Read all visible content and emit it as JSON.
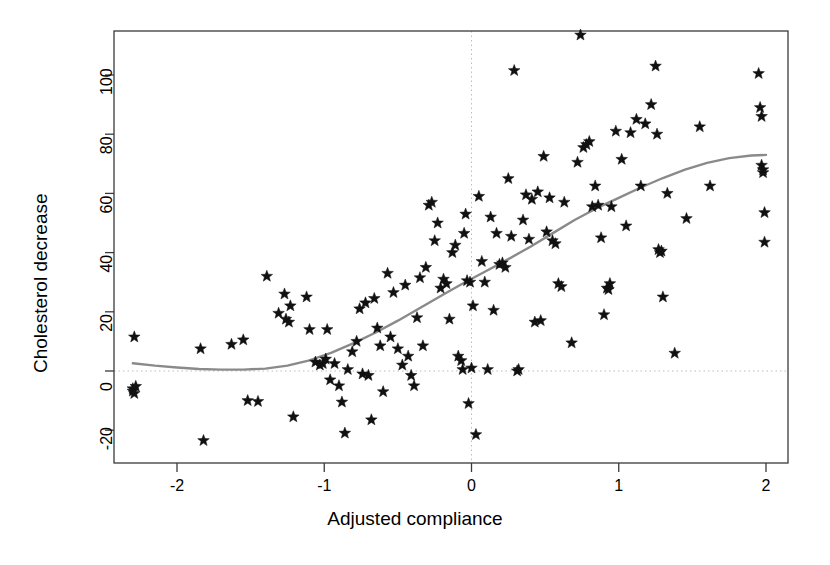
{
  "chart_data": {
    "type": "scatter",
    "title": "",
    "xlabel": "Adjusted compliance",
    "ylabel": "Cholesterol decrease",
    "xlim": [
      -2.38,
      2.15
    ],
    "ylim": [
      -27.5,
      116
    ],
    "xticks": [
      -2,
      -1,
      0,
      1,
      2
    ],
    "xtick_labels": [
      "-2",
      "-1",
      "0",
      "1",
      "2"
    ],
    "yticks": [
      -20,
      0,
      20,
      40,
      60,
      80,
      100
    ],
    "ytick_labels": [
      "-20",
      "0",
      "20",
      "40",
      "60",
      "80",
      "100"
    ],
    "grid": false,
    "reference_lines": [
      {
        "axis": "y",
        "value": 0,
        "style": "dotted",
        "color": "#bdbdbd"
      },
      {
        "axis": "x",
        "value": 0,
        "style": "dotted",
        "color": "#bdbdbd"
      }
    ],
    "legend": null,
    "marker": "star",
    "marker_color": "#111111",
    "marker_size": 9,
    "series": [
      {
        "name": "observations",
        "points": [
          [
            -2.29,
            11.5
          ],
          [
            -2.3,
            -6.0
          ],
          [
            -2.3,
            -6.8
          ],
          [
            -2.29,
            -7.6
          ],
          [
            -2.28,
            -5.2
          ],
          [
            -1.84,
            7.5
          ],
          [
            -1.82,
            -23.5
          ],
          [
            -1.63,
            9.0
          ],
          [
            -1.55,
            10.5
          ],
          [
            -1.52,
            -10.0
          ],
          [
            -1.45,
            -10.3
          ],
          [
            -1.39,
            32.0
          ],
          [
            -1.31,
            19.5
          ],
          [
            -1.27,
            26.0
          ],
          [
            -1.26,
            17.5
          ],
          [
            -1.24,
            16.5
          ],
          [
            -1.23,
            22.0
          ],
          [
            -1.21,
            -15.5
          ],
          [
            -1.12,
            25.0
          ],
          [
            -1.1,
            14.0
          ],
          [
            -1.06,
            3.0
          ],
          [
            -1.03,
            2.0
          ],
          [
            -1.01,
            2.5
          ],
          [
            -0.99,
            4.0
          ],
          [
            -0.98,
            14.0
          ],
          [
            -0.96,
            -3.0
          ],
          [
            -0.93,
            2.5
          ],
          [
            -0.9,
            -5.0
          ],
          [
            -0.88,
            -10.5
          ],
          [
            -0.86,
            -21.0
          ],
          [
            -0.84,
            0.5
          ],
          [
            -0.81,
            6.5
          ],
          [
            -0.78,
            10.0
          ],
          [
            -0.76,
            21.0
          ],
          [
            -0.74,
            -1.0
          ],
          [
            -0.72,
            23.0
          ],
          [
            -0.7,
            -1.5
          ],
          [
            -0.68,
            -16.5
          ],
          [
            -0.66,
            24.5
          ],
          [
            -0.64,
            14.5
          ],
          [
            -0.62,
            8.5
          ],
          [
            -0.6,
            -7.0
          ],
          [
            -0.57,
            33.0
          ],
          [
            -0.55,
            11.5
          ],
          [
            -0.53,
            26.5
          ],
          [
            -0.5,
            7.5
          ],
          [
            -0.47,
            2.0
          ],
          [
            -0.45,
            29.0
          ],
          [
            -0.43,
            5.0
          ],
          [
            -0.41,
            -1.5
          ],
          [
            -0.39,
            -5.0
          ],
          [
            -0.37,
            18.0
          ],
          [
            -0.35,
            31.5
          ],
          [
            -0.33,
            8.5
          ],
          [
            -0.31,
            35.0
          ],
          [
            -0.29,
            56.0
          ],
          [
            -0.27,
            57.0
          ],
          [
            -0.25,
            44.0
          ],
          [
            -0.23,
            50.0
          ],
          [
            -0.21,
            28.0
          ],
          [
            -0.19,
            31.0
          ],
          [
            -0.17,
            29.5
          ],
          [
            -0.15,
            17.5
          ],
          [
            -0.13,
            40.0
          ],
          [
            -0.11,
            42.5
          ],
          [
            -0.09,
            5.0
          ],
          [
            -0.07,
            3.5
          ],
          [
            -0.06,
            0.5
          ],
          [
            -0.05,
            46.5
          ],
          [
            -0.04,
            53.0
          ],
          [
            -0.03,
            30.5
          ],
          [
            -0.02,
            -11.0
          ],
          [
            -0.01,
            30.0
          ],
          [
            0.0,
            1.0
          ],
          [
            0.01,
            22.0
          ],
          [
            0.03,
            -21.5
          ],
          [
            0.05,
            59.0
          ],
          [
            0.07,
            37.0
          ],
          [
            0.09,
            30.0
          ],
          [
            0.11,
            0.5
          ],
          [
            0.13,
            52.0
          ],
          [
            0.15,
            20.5
          ],
          [
            0.17,
            46.5
          ],
          [
            0.19,
            36.0
          ],
          [
            0.21,
            36.5
          ],
          [
            0.23,
            35.0
          ],
          [
            0.25,
            65.0
          ],
          [
            0.27,
            45.5
          ],
          [
            0.29,
            101.5
          ],
          [
            0.31,
            0.0
          ],
          [
            0.32,
            0.5
          ],
          [
            0.35,
            51.0
          ],
          [
            0.37,
            59.5
          ],
          [
            0.39,
            44.5
          ],
          [
            0.41,
            58.0
          ],
          [
            0.43,
            16.5
          ],
          [
            0.45,
            60.5
          ],
          [
            0.47,
            17.0
          ],
          [
            0.49,
            72.5
          ],
          [
            0.51,
            47.0
          ],
          [
            0.53,
            58.5
          ],
          [
            0.55,
            44.0
          ],
          [
            0.57,
            43.0
          ],
          [
            0.59,
            29.5
          ],
          [
            0.61,
            28.5
          ],
          [
            0.63,
            57.0
          ],
          [
            0.68,
            9.5
          ],
          [
            0.72,
            70.5
          ],
          [
            0.74,
            113.5
          ],
          [
            0.76,
            75.5
          ],
          [
            0.78,
            76.5
          ],
          [
            0.8,
            77.5
          ],
          [
            0.82,
            55.5
          ],
          [
            0.84,
            62.5
          ],
          [
            0.86,
            56.0
          ],
          [
            0.88,
            45.0
          ],
          [
            0.9,
            19.0
          ],
          [
            0.92,
            28.0
          ],
          [
            0.93,
            27.5
          ],
          [
            0.94,
            29.5
          ],
          [
            0.95,
            55.5
          ],
          [
            0.98,
            81.0
          ],
          [
            1.02,
            71.5
          ],
          [
            1.05,
            49.0
          ],
          [
            1.08,
            80.5
          ],
          [
            1.12,
            85.0
          ],
          [
            1.15,
            62.5
          ],
          [
            1.18,
            83.5
          ],
          [
            1.22,
            90.0
          ],
          [
            1.25,
            103.0
          ],
          [
            1.26,
            80.0
          ],
          [
            1.27,
            41.0
          ],
          [
            1.28,
            40.0
          ],
          [
            1.29,
            40.5
          ],
          [
            1.3,
            25.0
          ],
          [
            1.33,
            60.0
          ],
          [
            1.38,
            6.0
          ],
          [
            1.46,
            51.5
          ],
          [
            1.55,
            82.5
          ],
          [
            1.62,
            62.5
          ],
          [
            1.95,
            100.5
          ],
          [
            1.96,
            89.0
          ],
          [
            1.97,
            86.0
          ],
          [
            1.97,
            69.5
          ],
          [
            1.98,
            68.0
          ],
          [
            1.98,
            67.0
          ],
          [
            1.99,
            53.5
          ],
          [
            1.99,
            43.5
          ]
        ]
      }
    ],
    "fit_line": {
      "name": "smoothed fit",
      "color": "#8a8a8a",
      "width": 2.4,
      "points": [
        [
          -2.3,
          2.6
        ],
        [
          -2.15,
          1.8
        ],
        [
          -2.0,
          1.2
        ],
        [
          -1.85,
          0.7
        ],
        [
          -1.7,
          0.45
        ],
        [
          -1.55,
          0.45
        ],
        [
          -1.4,
          0.8
        ],
        [
          -1.25,
          1.8
        ],
        [
          -1.1,
          3.6
        ],
        [
          -0.95,
          6.2
        ],
        [
          -0.8,
          9.4
        ],
        [
          -0.65,
          13.0
        ],
        [
          -0.5,
          17.0
        ],
        [
          -0.35,
          21.3
        ],
        [
          -0.2,
          25.6
        ],
        [
          -0.05,
          29.8
        ],
        [
          0.1,
          33.8
        ],
        [
          0.25,
          37.8
        ],
        [
          0.4,
          42.0
        ],
        [
          0.55,
          46.5
        ],
        [
          0.7,
          51.0
        ],
        [
          0.85,
          55.0
        ],
        [
          1.0,
          58.5
        ],
        [
          1.15,
          62.0
        ],
        [
          1.3,
          65.2
        ],
        [
          1.45,
          68.0
        ],
        [
          1.6,
          70.3
        ],
        [
          1.75,
          71.9
        ],
        [
          1.9,
          72.8
        ],
        [
          2.0,
          73.0
        ]
      ]
    }
  }
}
